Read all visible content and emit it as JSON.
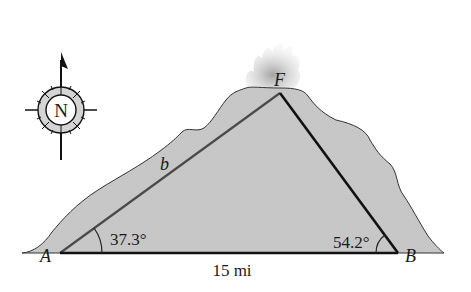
{
  "diagram": {
    "type": "volcano-triangle",
    "vertices": {
      "A": "A",
      "B": "B",
      "F": "F"
    },
    "side_labels": {
      "AF": "b",
      "AB": "15 mi"
    },
    "angles": {
      "A": "37.3°",
      "B": "54.2°"
    },
    "compass": {
      "label": "N",
      "icon": "compass-rose-icon"
    },
    "colors": {
      "mountain_fill": "#c8c8c8",
      "line": "#111111",
      "smoke": "#bdbdbd"
    }
  }
}
